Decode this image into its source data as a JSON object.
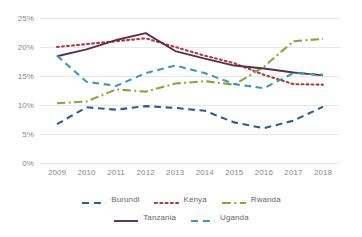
{
  "chart_data": {
    "type": "line",
    "title": "",
    "subtitle": "",
    "xlabel": "",
    "ylabel": "",
    "categories": [
      "2009",
      "2010",
      "2011",
      "2012",
      "2013",
      "2014",
      "2015",
      "2016",
      "2017",
      "2018"
    ],
    "x": [
      2009,
      2010,
      2011,
      2012,
      2013,
      2014,
      2015,
      2016,
      2017,
      2018
    ],
    "ylim": [
      0,
      25
    ],
    "ytick_labels": [
      "0%",
      "5%",
      "10%",
      "15%",
      "20%",
      "25%"
    ],
    "ytick_values": [
      0,
      5,
      10,
      15,
      20,
      25
    ],
    "grid": true,
    "grid_axis": "y",
    "legend_position": "bottom",
    "series": [
      {
        "name": "Burundi",
        "color": "#33579c",
        "dash": "dashed",
        "values": [
          6.7,
          9.6,
          9.2,
          9.8,
          9.5,
          9.0,
          7.0,
          6.0,
          7.3,
          9.7
        ]
      },
      {
        "name": "Kenya",
        "color": "#b03a3a",
        "dash": "dotted",
        "values": [
          20.0,
          20.5,
          21.0,
          21.5,
          20.0,
          18.5,
          17.2,
          15.2,
          13.6,
          13.5
        ]
      },
      {
        "name": "Rwanda",
        "color": "#8aa43c",
        "dash": "dash-dot",
        "values": [
          10.3,
          10.6,
          12.7,
          12.3,
          13.7,
          14.1,
          13.5,
          16.6,
          21.0,
          21.4
        ]
      },
      {
        "name": "Tanzania",
        "color": "#5b2f4e",
        "dash": "solid",
        "values": [
          18.4,
          19.6,
          21.2,
          22.4,
          19.3,
          18.0,
          16.8,
          16.3,
          15.6,
          15.1
        ]
      },
      {
        "name": "Uganda",
        "color": "#3e9ab5",
        "dash": "dashed",
        "values": [
          18.5,
          14.0,
          13.3,
          15.5,
          16.8,
          15.5,
          13.6,
          12.9,
          15.5,
          15.2
        ]
      }
    ]
  },
  "legend": {
    "row1": [
      {
        "label": "Burundi",
        "color": "#33579c",
        "dash": "dashed"
      },
      {
        "label": "Kenya",
        "color": "#b03a3a",
        "dash": "dotted"
      },
      {
        "label": "Rwanda",
        "color": "#8aa43c",
        "dash": "dash-dot"
      }
    ],
    "row2": [
      {
        "label": "Tanzania",
        "color": "#5b2f4e",
        "dash": "solid"
      },
      {
        "label": "Uganda",
        "color": "#3e9ab5",
        "dash": "dashed"
      }
    ]
  },
  "colors": {
    "background": "#ffffff",
    "gridline": "#e8e8e8",
    "axis_text": "#8a8a8a",
    "legend_text": "#666666"
  }
}
